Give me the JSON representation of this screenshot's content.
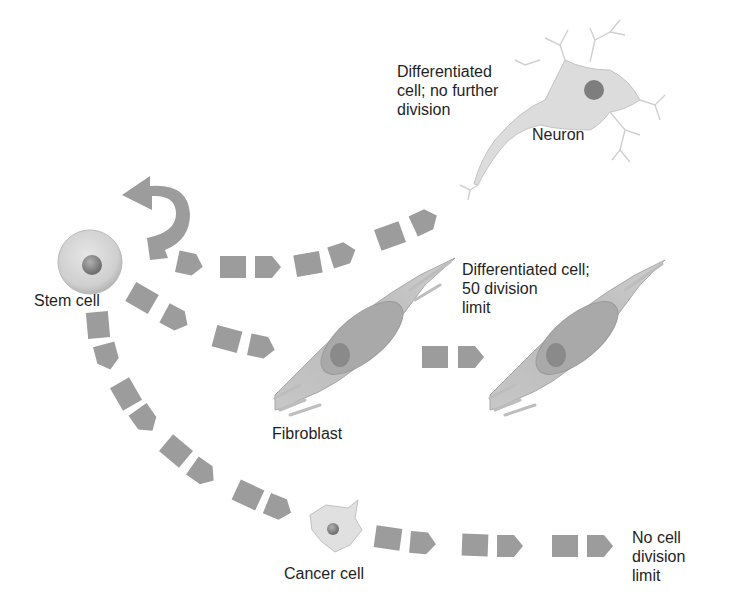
{
  "colors": {
    "arrow": "#9c9c9c",
    "cell_fill": "#d9d9d9",
    "cell_edge": "#b0b0b0",
    "nucleus": "#7a7a7a",
    "text": "#1f1f1f"
  },
  "labels": {
    "stem_cell": "Stem cell",
    "neuron": "Neuron",
    "neuron_note": "Differentiated\ncell; no further\ndivision",
    "fibroblast": "Fibroblast",
    "fibroblast_note": "Differentiated cell;\n50 division\nlimit",
    "cancer_cell": "Cancer cell",
    "cancer_note": "No cell\ndivision\nlimit"
  },
  "pathways": [
    {
      "from": "Stem cell",
      "to": "Stem cell",
      "type": "self-renewal"
    },
    {
      "from": "Stem cell",
      "to": "Neuron",
      "type": "differentiation"
    },
    {
      "from": "Stem cell",
      "to": "Fibroblast",
      "type": "differentiation"
    },
    {
      "from": "Fibroblast",
      "to": "Fibroblast",
      "type": "division"
    },
    {
      "from": "Stem cell",
      "to": "Cancer cell",
      "type": "transformation"
    },
    {
      "from": "Cancer cell",
      "to": "unlimited",
      "type": "division"
    }
  ]
}
